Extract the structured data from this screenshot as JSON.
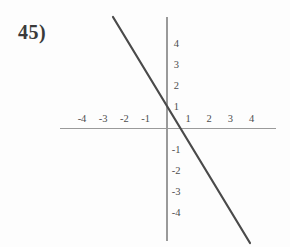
{
  "problem": {
    "label": "45)"
  },
  "axes": {
    "color": "#9a9a9a",
    "origin_px": {
      "x": 166.8,
      "y": 128.6
    },
    "unit_px": 21.2,
    "x_range": [
      -5.0,
      5.1
    ],
    "y_range": [
      -5.3,
      5.3
    ]
  },
  "ticks": {
    "x_negative": [
      "-4",
      "-3",
      "-2",
      "-1"
    ],
    "x_positive": [
      "1",
      "2",
      "3",
      "4"
    ],
    "y_positive": [
      "4",
      "3",
      "2",
      "1"
    ],
    "y_negative": [
      "-1",
      "-2",
      "-3",
      "-4"
    ]
  },
  "line": {
    "color": "#4a4a4a",
    "width_px": 2.2
  },
  "chart_data": {
    "type": "line",
    "title": "",
    "xlabel": "",
    "ylabel": "",
    "xlim": [
      -5,
      5
    ],
    "ylim": [
      -5.3,
      5.3
    ],
    "xticks": [
      -4,
      -3,
      -2,
      -1,
      1,
      2,
      3,
      4
    ],
    "yticks": [
      4,
      3,
      2,
      1,
      -1,
      -2,
      -3,
      -4
    ],
    "grid": false,
    "legend": "none",
    "series": [
      {
        "name": "line",
        "slope": -1.65,
        "intercept": 0.9,
        "x": [
          -2.54,
          3.93
        ],
        "y": [
          5.09,
          -5.39
        ],
        "endpoints_px": [
          {
            "x": 113,
            "y": 17
          },
          {
            "x": 250,
            "y": 243
          }
        ]
      }
    ]
  }
}
